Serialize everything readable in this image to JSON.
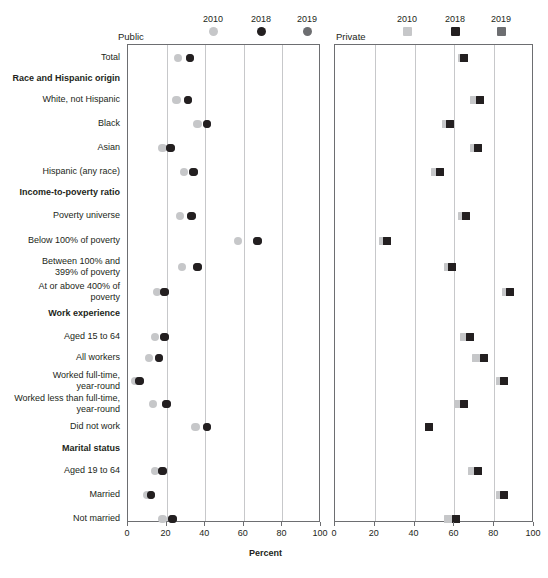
{
  "legend": {
    "public": {
      "panel_label": "Public",
      "years": [
        "2010",
        "2018",
        "2019"
      ],
      "marker_shape": "circle"
    },
    "private": {
      "panel_label": "Private",
      "years": [
        "2010",
        "2018",
        "2019"
      ],
      "marker_shape": "square"
    }
  },
  "colors": {
    "y2010": "#c6c7c9",
    "y2018": "#231f20",
    "y2019": "#6d6e71",
    "axis": "#6d6e71",
    "grid": "#c7c8ca",
    "text": "#231f20"
  },
  "axis": {
    "title": "Percent",
    "ticks": [
      "0",
      "20",
      "40",
      "60",
      "80",
      "100"
    ],
    "min": 0,
    "max": 100
  },
  "rows": [
    {
      "label": "Total",
      "type": "item"
    },
    {
      "label": "Race and Hispanic origin",
      "type": "header"
    },
    {
      "label": "White, not Hispanic",
      "type": "item"
    },
    {
      "label": "Black",
      "type": "item"
    },
    {
      "label": "Asian",
      "type": "item"
    },
    {
      "label": "Hispanic (any race)",
      "type": "item"
    },
    {
      "label": "Income-to-poverty ratio",
      "type": "header"
    },
    {
      "label": "Poverty universe",
      "type": "item"
    },
    {
      "label": "Below 100% of poverty",
      "type": "item"
    },
    {
      "label": "Between 100% and\n399% of poverty",
      "type": "item"
    },
    {
      "label": "At or above 400% of\npoverty",
      "type": "item"
    },
    {
      "label": "Work experience",
      "type": "header"
    },
    {
      "label": "Aged 15 to 64",
      "type": "item"
    },
    {
      "label": "All workers",
      "type": "item"
    },
    {
      "label": "Worked full-time,\nyear-round",
      "type": "item"
    },
    {
      "label": "Worked less than full-time,\nyear-round",
      "type": "item"
    },
    {
      "label": "Did not work",
      "type": "item"
    },
    {
      "label": "Marital status",
      "type": "header"
    },
    {
      "label": "Aged 19 to 64",
      "type": "item"
    },
    {
      "label": "Married",
      "type": "item"
    },
    {
      "label": "Not married",
      "type": "item"
    }
  ],
  "chart_data": [
    {
      "type": "scatter",
      "title": "Public",
      "xlabel": "Percent",
      "ylabel": "",
      "xlim": [
        0,
        100
      ],
      "grid": true,
      "legend_position": "top",
      "marker": "circle",
      "categories": [
        "Total",
        "White, not Hispanic",
        "Black",
        "Asian",
        "Hispanic (any race)",
        "Poverty universe",
        "Below 100% of poverty",
        "Between 100% and 399% of poverty",
        "At or above 400% of poverty",
        "Aged 15 to 64",
        "All workers",
        "Worked full-time, year-round",
        "Worked less than full-time, year-round",
        "Did not work",
        "Aged 19 to 64",
        "Married",
        "Not married"
      ],
      "series": [
        {
          "name": "2010",
          "values": [
            26,
            25,
            36,
            18,
            29,
            27,
            57,
            28,
            15,
            14,
            11,
            4,
            13,
            35,
            14,
            10,
            18
          ]
        },
        {
          "name": "2018",
          "values": [
            32,
            31,
            41,
            22,
            34,
            33,
            67,
            36,
            19,
            19,
            16,
            6,
            20,
            41,
            18,
            12,
            23
          ]
        },
        {
          "name": "2019",
          "values": [
            32,
            31,
            41,
            22,
            34,
            33,
            67,
            36,
            19,
            19,
            16,
            6,
            20,
            41,
            18,
            12,
            23
          ]
        }
      ]
    },
    {
      "type": "scatter",
      "title": "Private",
      "xlabel": "Percent",
      "ylabel": "",
      "xlim": [
        0,
        100
      ],
      "grid": true,
      "legend_position": "top",
      "marker": "square",
      "categories": [
        "Total",
        "White, not Hispanic",
        "Black",
        "Asian",
        "Hispanic (any race)",
        "Poverty universe",
        "Below 100% of poverty",
        "Between 100% and 399% of poverty",
        "At or above 400% of poverty",
        "Aged 15 to 64",
        "All workers",
        "Worked full-time, year-round",
        "Worked less than full-time, year-round",
        "Did not work",
        "Aged 19 to 64",
        "Married",
        "Not married"
      ],
      "series": [
        {
          "name": "2010",
          "values": [
            64,
            70,
            56,
            70,
            50,
            64,
            24,
            57,
            86,
            65,
            71,
            83,
            62,
            47,
            69,
            83,
            57
          ]
        },
        {
          "name": "2018",
          "values": [
            65,
            73,
            58,
            72,
            53,
            66,
            26,
            59,
            88,
            68,
            75,
            85,
            65,
            47,
            72,
            85,
            61
          ]
        },
        {
          "name": "2019",
          "values": [
            65,
            73,
            58,
            72,
            53,
            66,
            26,
            59,
            88,
            68,
            75,
            85,
            65,
            47,
            72,
            85,
            61
          ]
        }
      ]
    }
  ]
}
